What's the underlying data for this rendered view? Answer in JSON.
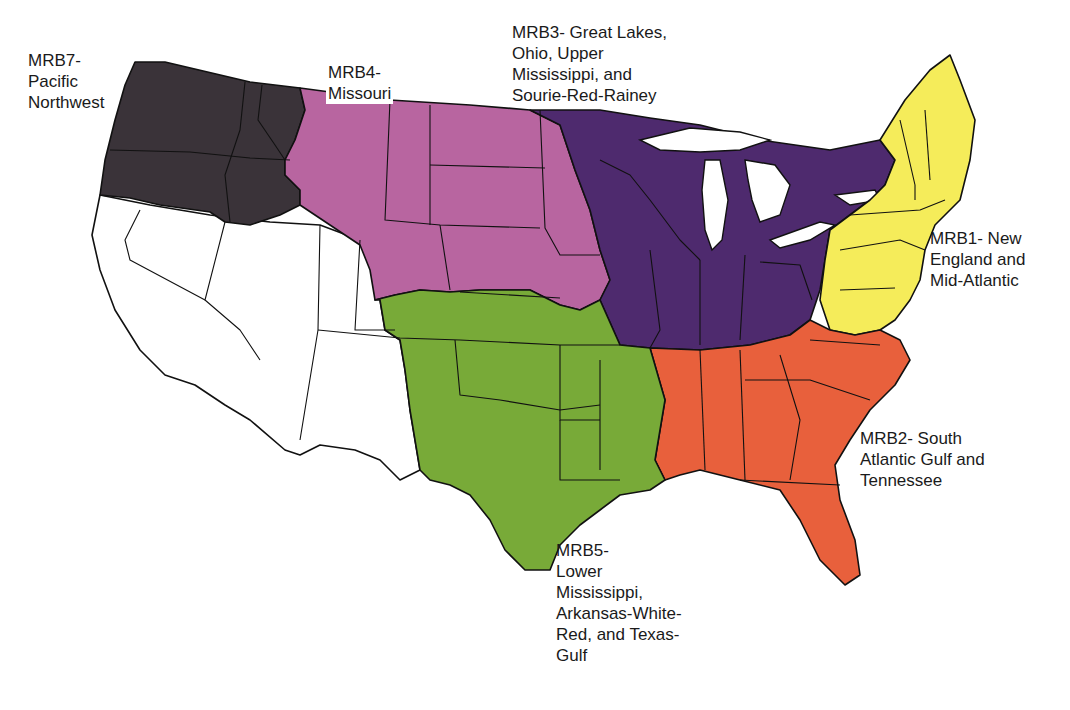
{
  "map": {
    "title": "Major Resource Basins of the Conterminous United States",
    "colors": {
      "mrb1": "#f5ec5a",
      "mrb2": "#e8603c",
      "mrb3": "#4e2a6e",
      "mrb4": "#b865a0",
      "mrb5": "#78aa38",
      "mrb7": "#3a3339",
      "unlabeled": "#ffffff",
      "outline": "#111111"
    },
    "regions": [
      {
        "id": "mrb1",
        "label": "MRB1- New\nEngland and\nMid-Atlantic"
      },
      {
        "id": "mrb2",
        "label": "MRB2- South\nAtlantic Gulf and\nTennessee"
      },
      {
        "id": "mrb3",
        "label": "MRB3- Great Lakes,\nOhio, Upper\nMississippi, and\nSourie-Red-Rainey"
      },
      {
        "id": "mrb4",
        "label": "MRB4-\nMissouri"
      },
      {
        "id": "mrb5",
        "label": "MRB5-\nLower\nMississippi,\nArkansas-White-\nRed, and Texas-\nGulf"
      },
      {
        "id": "mrb7",
        "label": "MRB7-\nPacific\nNorthwest"
      }
    ]
  }
}
